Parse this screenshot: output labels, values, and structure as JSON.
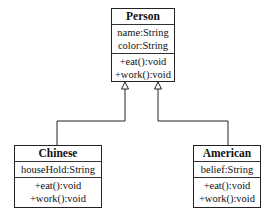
{
  "diagram": {
    "type": "uml-class-diagram",
    "classes": [
      {
        "name": "Person",
        "attributes": [
          "name:String",
          "color:String"
        ],
        "methods": [
          "+eat():void",
          "+work():void"
        ]
      },
      {
        "name": "Chinese",
        "attributes": [
          "houseHold:String"
        ],
        "methods": [
          "+eat():void",
          "+work():void"
        ]
      },
      {
        "name": "American",
        "attributes": [
          "belief:String"
        ],
        "methods": [
          "+eat():void",
          "+work():void"
        ]
      }
    ],
    "relations": [
      {
        "type": "generalization",
        "from": "Chinese",
        "to": "Person"
      },
      {
        "type": "generalization",
        "from": "American",
        "to": "Person"
      }
    ]
  }
}
